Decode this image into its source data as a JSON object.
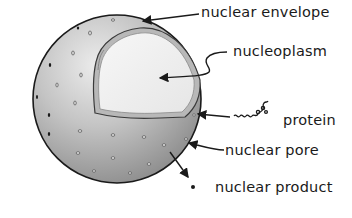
{
  "diagram": {
    "labels": {
      "nuclear_envelope": "nuclear envelope",
      "nucleoplasm": "nucleoplasm",
      "protein": "protein",
      "nuclear_pore": "nuclear pore",
      "nuclear_product": "nuclear product"
    },
    "colors": {
      "sphere_light": "#e2e2e2",
      "sphere_dark": "#8e8e8e",
      "nucleoplasm": "#f2f2f2",
      "envelope_rim": "#b5b5b5",
      "outline": "#1a1a1a"
    }
  }
}
